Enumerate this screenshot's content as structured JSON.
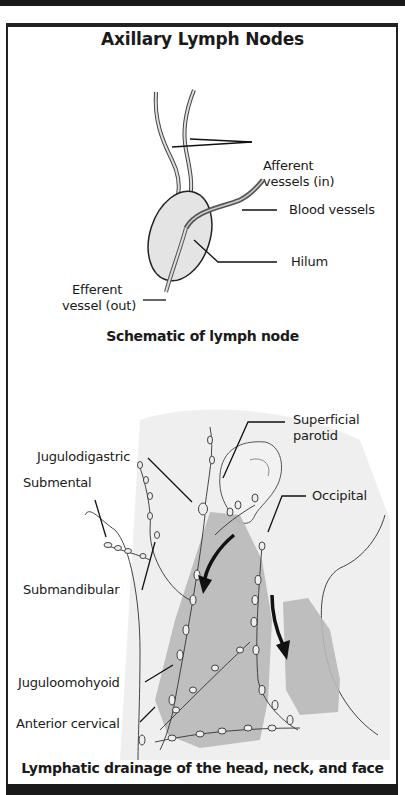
{
  "title": "Axillary Lymph Nodes",
  "schematic": {
    "caption": "Schematic of lymph node",
    "labels": {
      "afferent_line1": "Afferent",
      "afferent_line2": "vessels (in)",
      "blood_vessels": "Blood vessels",
      "hilum": "Hilum",
      "efferent_line1": "Efferent",
      "efferent_line2": "vessel (out)"
    }
  },
  "drainage": {
    "caption": "Lymphatic drainage of the head, neck, and face",
    "labels": {
      "superficial_parotid_line1": "Superficial",
      "superficial_parotid_line2": "parotid",
      "jugulodigastric": "Jugulodigastric",
      "submental": "Submental",
      "occipital": "Occipital",
      "submandibular": "Submandibular",
      "juguloomohyoid": "Juguloomohyoid",
      "anterior_cervical": "Anterior cervical"
    }
  },
  "colors": {
    "ink": "#1a1a1a",
    "node_fill": "#e4e4e4",
    "muscle_fill": "#b8b8b8",
    "skin_shade": "#ececec"
  }
}
